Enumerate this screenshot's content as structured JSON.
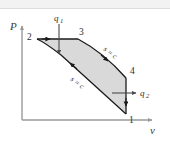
{
  "figure": {
    "type": "pv-diagram",
    "title": "",
    "axes": {
      "y_label": "P",
      "x_label": "v",
      "y_name": "pressure-axis",
      "x_name": "volume-axis"
    },
    "colors": {
      "fill": "#d9d9d9",
      "stroke": "#1a1a1a",
      "axis": "#9a9a9a",
      "text": "#2e2e2e",
      "background": "#ffffff",
      "band": "#f2f2f2"
    },
    "states": [
      {
        "id": "1",
        "label": "1",
        "x": 128,
        "y": 113
      },
      {
        "id": "2",
        "label": "2",
        "x": 32,
        "y": 37
      },
      {
        "id": "3",
        "label": "3",
        "x": 80,
        "y": 36
      },
      {
        "id": "4",
        "label": "4",
        "x": 131,
        "y": 74
      }
    ],
    "heat_flows": [
      {
        "id": "q1",
        "label": "q",
        "subscript": "1",
        "direction": "down",
        "description": "heat-added-q1"
      },
      {
        "id": "q2",
        "label": "q",
        "subscript": "2",
        "direction": "right",
        "description": "heat-rejected-q2"
      }
    ],
    "process_labels": [
      {
        "id": "sc-upper",
        "text": "s = c",
        "description": "isentropic-process-3-to-4"
      },
      {
        "id": "sc-lower",
        "text": "s = c",
        "description": "isentropic-process-1-to-2"
      }
    ],
    "processes": [
      {
        "from": "2",
        "to": "3",
        "kind": "constant-pressure-heat-addition"
      },
      {
        "from": "3",
        "to": "4",
        "kind": "isentropic-expansion"
      },
      {
        "from": "4",
        "to": "1",
        "kind": "constant-pressure-heat-rejection"
      },
      {
        "from": "1",
        "to": "2",
        "kind": "isentropic-compression"
      }
    ]
  }
}
